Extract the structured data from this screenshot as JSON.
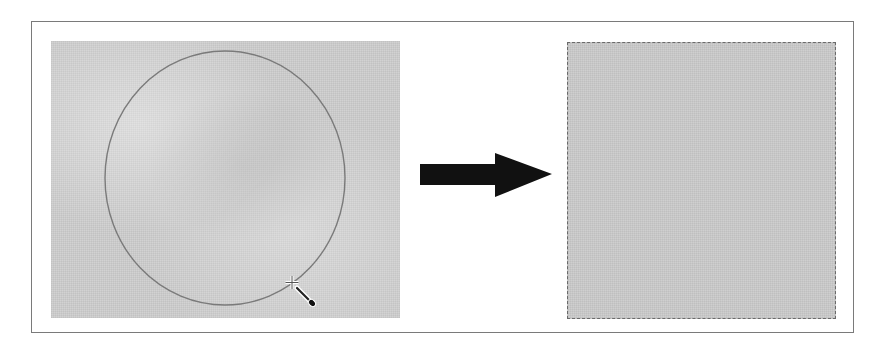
{
  "diagram": {
    "source_panel": {
      "shape": "circle-selection",
      "texture_color": "#d2d2d2",
      "outline_color": "#7a7a7a",
      "cursor": "magic-wand-cursor"
    },
    "arrow": {
      "direction": "right",
      "color": "#111111"
    },
    "result_panel": {
      "shape": "rectangle-selection",
      "texture_color": "#cfcfcf",
      "border_style": "dashed"
    },
    "colors": {
      "frame_border": "#7a7a7a",
      "background": "#ffffff"
    }
  }
}
